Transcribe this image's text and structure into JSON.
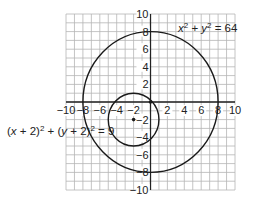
{
  "chart_data": {
    "type": "scatter",
    "title": "",
    "xlabel": "",
    "ylabel": "",
    "xlim": [
      -10,
      10
    ],
    "ylim": [
      -10,
      10
    ],
    "grid": true,
    "grid_step": 1,
    "x_ticks": [
      -10,
      -8,
      -6,
      -4,
      -2,
      2,
      4,
      6,
      8,
      10
    ],
    "y_ticks": [
      10,
      8,
      6,
      4,
      2,
      -2,
      -4,
      -6,
      -8,
      -10
    ],
    "x_tick_labels": [
      "−10",
      "−8",
      "−6",
      "−4",
      "−2",
      "2",
      "4",
      "6",
      "8",
      "10"
    ],
    "y_tick_labels": [
      "10",
      "8",
      "6",
      "4",
      "2",
      "−2",
      "−4",
      "−6",
      "−8",
      "−10"
    ],
    "series": [
      {
        "name": "x^2 + y^2 = 64",
        "shape": "circle",
        "center": [
          0,
          0
        ],
        "radius": 8
      },
      {
        "name": "(x + 2)^2 + (y + 2)^2 = 9",
        "shape": "circle",
        "center": [
          -2,
          -2
        ],
        "radius": 3
      }
    ],
    "points": [
      {
        "label": "center",
        "x": -2,
        "y": -2
      },
      {
        "label": "intersection",
        "x": 0,
        "y": 0
      }
    ],
    "annotations": [
      {
        "text": "x² + y² = 64",
        "near": "upper right"
      },
      {
        "text": "(x + 2)² + (y + 2)² = 9",
        "near": "left"
      }
    ]
  },
  "labels": {
    "big_circle_eq": {
      "a": "x",
      "a_sup": "2",
      "mid": " + ",
      "b": "y",
      "b_sup": "2",
      "rest": " = 64"
    },
    "small_circle_eq": {
      "p1": "(",
      "x": "x",
      "p2": " + 2)",
      "sup1": "2",
      "p3": " + (",
      "y": "y",
      "p4": " + 2)",
      "sup2": "2",
      "rest": " = 9"
    }
  },
  "colors": {
    "grid": "#b5b5b5",
    "axis": "#222222",
    "curve": "#1a1a1a"
  }
}
